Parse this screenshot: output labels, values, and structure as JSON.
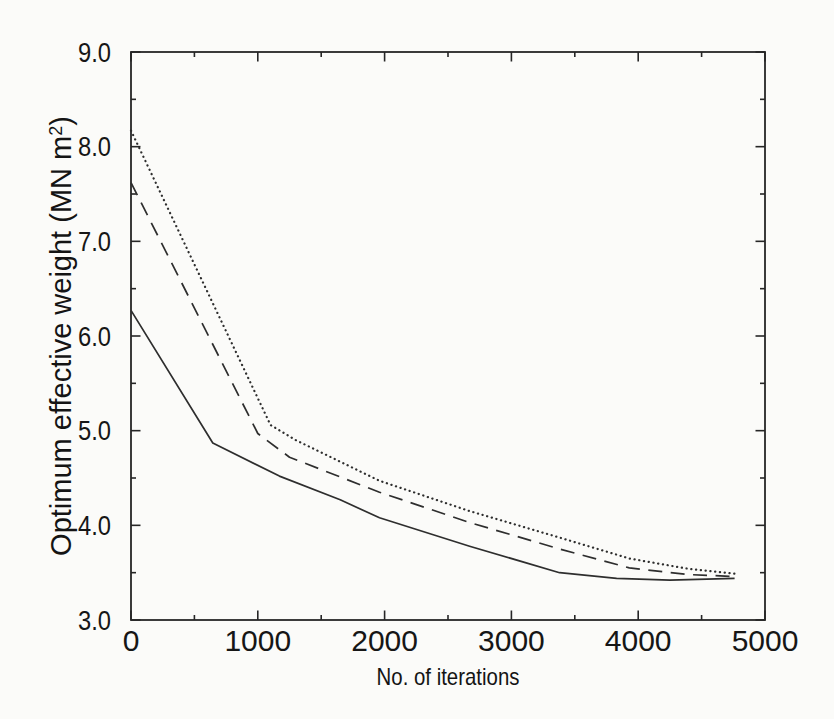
{
  "figure": {
    "background": "#fbfbf9",
    "axis_color": "#262626",
    "curve_color": "#2e2e2e",
    "tick_label_color": "#161616"
  },
  "chart_data": {
    "type": "line",
    "title": "",
    "xlabel": "No. of iterations",
    "ylabel": "Optimum effective weight (MN m²)",
    "ylabel_parts": {
      "main": "Optimum effective weight (MN m",
      "sup": "2",
      "close": ")"
    },
    "xlim": [
      0,
      5000
    ],
    "ylim": [
      3.0,
      9.0
    ],
    "grid": false,
    "legend": "none",
    "frame": "closed box with inward major and minor ticks on all four sides",
    "x_ticks": [
      {
        "value": 0,
        "label": "0"
      },
      {
        "value": 1000,
        "label": "1000"
      },
      {
        "value": 2000,
        "label": "2000"
      },
      {
        "value": 3000,
        "label": "3000"
      },
      {
        "value": 4000,
        "label": "4000"
      },
      {
        "value": 5000,
        "label": "5000"
      }
    ],
    "x_minor_ticks": [
      500,
      1500,
      2500,
      3500,
      4500
    ],
    "y_ticks": [
      {
        "value": 3.0,
        "label": "3.0"
      },
      {
        "value": 4.0,
        "label": "4.0"
      },
      {
        "value": 5.0,
        "label": "5.0"
      },
      {
        "value": 6.0,
        "label": "6.0"
      },
      {
        "value": 7.0,
        "label": "7.0"
      },
      {
        "value": 8.0,
        "label": "8.0"
      },
      {
        "value": 9.0,
        "label": "9.0"
      }
    ],
    "y_minor_ticks": [
      3.5,
      4.5,
      5.5,
      6.5,
      7.5,
      8.5
    ],
    "series": [
      {
        "name": "curve-solid",
        "style": "solid",
        "points": [
          [
            0,
            6.27
          ],
          [
            645,
            4.87
          ],
          [
            1170,
            4.52
          ],
          [
            1650,
            4.27
          ],
          [
            1960,
            4.08
          ],
          [
            2670,
            3.78
          ],
          [
            3380,
            3.5
          ],
          [
            3830,
            3.44
          ],
          [
            4250,
            3.42
          ],
          [
            4760,
            3.44
          ]
        ]
      },
      {
        "name": "curve-dashed",
        "style": "dashed",
        "points": [
          [
            0,
            7.62
          ],
          [
            1000,
            4.97
          ],
          [
            1250,
            4.72
          ],
          [
            1960,
            4.35
          ],
          [
            2670,
            4.03
          ],
          [
            3380,
            3.75
          ],
          [
            3930,
            3.55
          ],
          [
            4400,
            3.48
          ],
          [
            4760,
            3.46
          ]
        ]
      },
      {
        "name": "curve-dotted",
        "style": "dotted",
        "points": [
          [
            0,
            8.17
          ],
          [
            1100,
            5.06
          ],
          [
            1300,
            4.9
          ],
          [
            1960,
            4.47
          ],
          [
            2670,
            4.15
          ],
          [
            3380,
            3.87
          ],
          [
            3930,
            3.65
          ],
          [
            4400,
            3.54
          ],
          [
            4760,
            3.49
          ]
        ]
      }
    ]
  }
}
